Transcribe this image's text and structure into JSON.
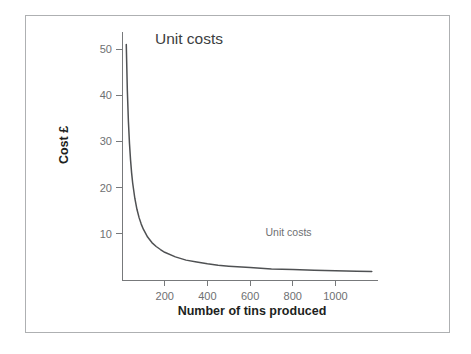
{
  "figure": {
    "frame_color": "#aeb0b2",
    "background": "#ffffff"
  },
  "chart_data": {
    "type": "line",
    "title": "Unit costs",
    "xlabel": "Number of tins produced",
    "ylabel": "Cost £",
    "xlim": [
      0,
      1200
    ],
    "ylim": [
      0,
      55
    ],
    "grid": false,
    "legend_position": "inline-right",
    "axis_color": "#77797b",
    "line_color": "#4f5153",
    "xticks": [
      200,
      400,
      600,
      800,
      1000
    ],
    "xtick_labels": [
      "200",
      "400",
      "600",
      "800",
      "1000"
    ],
    "yticks": [
      10,
      20,
      30,
      40,
      50
    ],
    "ytick_labels": [
      "10",
      "20",
      "30",
      "40",
      "50"
    ],
    "annotations": [
      {
        "text": "Unit costs",
        "x": 780,
        "y": 9.5
      }
    ],
    "series": [
      {
        "name": "Unit costs",
        "formula": "cost = 1000 / quantity + 1",
        "x": [
          20,
          25,
          30,
          35,
          40,
          45,
          50,
          60,
          70,
          80,
          90,
          100,
          120,
          140,
          160,
          180,
          200,
          250,
          300,
          350,
          400,
          450,
          500,
          600,
          700,
          800,
          900,
          1000,
          1100,
          1170
        ],
        "values": [
          51.0,
          41.0,
          34.3,
          29.6,
          26.0,
          23.2,
          21.0,
          17.7,
          15.3,
          13.5,
          12.1,
          11.0,
          9.3,
          8.1,
          7.25,
          6.6,
          6.0,
          5.0,
          4.3,
          3.9,
          3.5,
          3.2,
          3.0,
          2.7,
          2.4,
          2.25,
          2.1,
          2.0,
          1.9,
          1.85
        ]
      }
    ]
  },
  "geometry": {
    "origin_px_x": 122,
    "origin_px_y": 280,
    "x_scale_px_per_unit": 0.2135,
    "y_scale_px_per_unit": 4.62,
    "y_axis_top_px": 32,
    "x_axis_right_px": 378,
    "title_px_x": 155,
    "title_px_y": 44,
    "xlabel_px_y": 315,
    "ylabel_px_x": 68,
    "ylabel_px_y": 145
  }
}
